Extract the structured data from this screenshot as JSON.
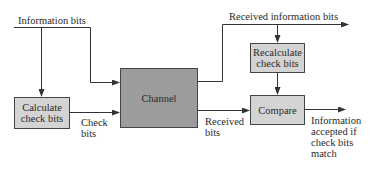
{
  "diagram": {
    "type": "error-detection-flow",
    "colors": {
      "line": "#333333",
      "light_box": "#d4d4d4",
      "dark_box": "#9c9c9c"
    },
    "nodes": {
      "calculate": {
        "line1": "Calculate",
        "line2": "check bits"
      },
      "channel": {
        "label": "Channel"
      },
      "recalculate": {
        "line1": "Recalculate",
        "line2": "check bits"
      },
      "compare": {
        "label": "Compare"
      }
    },
    "labels": {
      "information_bits": "Information bits",
      "received_information_bits": "Received information bits",
      "check_bits_line1": "Check",
      "check_bits_line2": "bits",
      "received_bits_line1": "Received",
      "received_bits_line2": "bits",
      "output_line1": "Information",
      "output_line2": "accepted if",
      "output_line3": "check bits",
      "output_line4": "match"
    }
  }
}
